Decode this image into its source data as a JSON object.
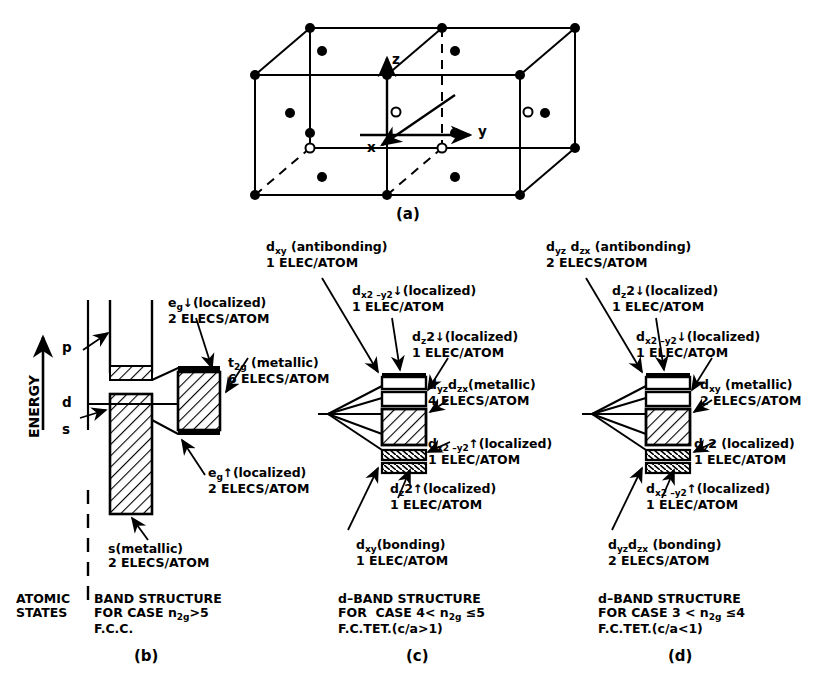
{
  "figure": {
    "kind": "scientific-figure",
    "panels": [
      "(a)",
      "(b)",
      "(c)",
      "(d)"
    ]
  },
  "panel_a": {
    "id": "(a)",
    "axes": {
      "x": "x",
      "y": "y",
      "z": "z"
    },
    "legend_note": "filled circles and open circles mark lattice sites"
  },
  "panel_b": {
    "id": "(b)",
    "energy_axis": "ENERGY",
    "atomic_labels": {
      "p": "p",
      "d": "d",
      "s": "s"
    },
    "annotations": [
      {
        "name": "eg-down-localized",
        "line1": "e",
        "sub1": "g",
        "arrow": "↓",
        "rest1": "(localized)",
        "line2": "2 ELECS/ATOM"
      },
      {
        "name": "t2g-metallic",
        "line1": "t",
        "sub1": "2g",
        "rest1": " (metallic)",
        "line2": "6 ELECS/ATOM"
      },
      {
        "name": "eg-up-localized",
        "line1": "e",
        "sub1": "g",
        "arrow": "↑",
        "rest1": "(localized)",
        "line2": "2 ELECS/ATOM"
      },
      {
        "name": "s-metallic",
        "line1": "s(metallic)",
        "line2": "2 ELECS/ATOM"
      }
    ],
    "caption_left": [
      "ATOMIC",
      "STATES"
    ],
    "caption_right_l1": "BAND STRUCTURE",
    "caption_right_l2_pre": "FOR CASE n",
    "caption_right_l2_sub": "2g",
    "caption_right_l2_post": ">5",
    "caption_right_l3": "F.C.C."
  },
  "panel_c": {
    "id": "(c)",
    "annotations": [
      {
        "name": "dxy-antibonding",
        "base": "d",
        "sub": "xy",
        "rest": " (antibonding)",
        "count": "1 ELEC/ATOM"
      },
      {
        "name": "dx2-y2-down-localized",
        "base": "d",
        "sub": "x2 –y2",
        "arrow": "↓",
        "rest": "(localized)",
        "count": "1 ELEC/ATOM"
      },
      {
        "name": "dz2-down-localized",
        "base": "d",
        "sub": "z",
        "sup": "2",
        "arrow": "↓",
        "rest": "(localized)",
        "count": "1 ELEC/ATOM"
      },
      {
        "name": "dyz-dzx-metallic",
        "base": "d",
        "sub": "yz",
        "base2": "d",
        "sub2": "zx",
        "rest": "(metallic)",
        "count": "4 ELECS/ATOM"
      },
      {
        "name": "dx2-y2-up-localized",
        "base": "d",
        "sub": "x2 –y2",
        "arrow": "↑",
        "rest": "(localized)",
        "count": "1 ELEC/ATOM"
      },
      {
        "name": "dz2-up-localized",
        "base": "d",
        "sub": "z",
        "sup": "2",
        "arrow": "↑",
        "rest": "(localized)",
        "count": "1 ELEC/ATOM"
      },
      {
        "name": "dxy-bonding",
        "base": "d",
        "sub": "xy",
        "rest": "(bonding)",
        "count": "1 ELEC/ATOM"
      }
    ],
    "caption_l1": "d–BAND STRUCTURE",
    "caption_l2_pre": "FOR  CASE 4< n",
    "caption_l2_sub": "2g",
    "caption_l2_post": " ≤5",
    "caption_l3": "F.C.TET.(c/a>1)"
  },
  "panel_d": {
    "id": "(d)",
    "annotations": [
      {
        "name": "dyz-dzx-antibonding",
        "base": "d",
        "sub": "yz",
        "base2": "d",
        "sub2": "zx",
        "rest": " (antibonding)",
        "count": "2 ELECS/ATOM"
      },
      {
        "name": "dz2-down-localized",
        "base": "d",
        "sub": "z",
        "sup": "2",
        "arrow": "↓",
        "rest": "(localized)",
        "count": "1 ELEC/ATOM"
      },
      {
        "name": "dx2-y2-down-localized",
        "base": "d",
        "sub": "x2 –y2",
        "arrow": "↓",
        "rest": "(localized)",
        "count": "1 ELEC/ATOM"
      },
      {
        "name": "dxy-metallic",
        "base": "d",
        "sub": "xy",
        "rest": " (metallic)",
        "count": "2 ELECS/ATOM"
      },
      {
        "name": "dz2-localized",
        "base": "d",
        "sub": "z",
        "sup": "2",
        "rest": " (localized)",
        "count": "1 ELEC/ATOM"
      },
      {
        "name": "dx2-y2-up-localized",
        "base": "d",
        "sub": "x2 –y2",
        "arrow": "↑",
        "rest": "(localized)",
        "count": "1 ELEC/ATOM"
      },
      {
        "name": "dyz-dzx-bonding",
        "base": "d",
        "sub": "yz",
        "base2": "d",
        "sub2": "zx",
        "rest": " (bonding)",
        "count": "2 ELECS/ATOM"
      }
    ],
    "caption_l1": "d–BAND STRUCTURE",
    "caption_l2_pre": "FOR CASE 3 < n",
    "caption_l2_sub": "2g",
    "caption_l2_post": " ≤4",
    "caption_l3": "F.C.TET.(c/a<1)"
  },
  "colors": {
    "ink": "#000000",
    "paper": "#ffffff"
  }
}
